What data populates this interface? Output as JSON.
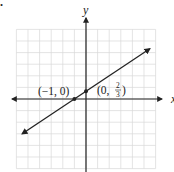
{
  "chart_data": {
    "type": "line",
    "title": "",
    "xlabel": "x",
    "ylabel": "y",
    "xlim": [
      -6,
      6
    ],
    "ylim": [
      -6,
      6
    ],
    "grid": true,
    "grid_step": 1,
    "series": [
      {
        "name": "line",
        "equation": "y = (2/3)x + 2/3",
        "slope": 0.6667,
        "intercept": 0.6667,
        "x": [
          -5.5,
          5.5
        ],
        "values": [
          -3.0,
          4.33
        ]
      }
    ],
    "points": [
      {
        "x": -1,
        "y": 0,
        "label": "(−1, 0)"
      },
      {
        "x": 0,
        "y": 0.6667,
        "label": "(0, 2/3)"
      }
    ],
    "annotations": [
      "(−1, 0)",
      "(0, 2/3)"
    ]
  },
  "labels": {
    "y_axis": "y",
    "x_axis": "x",
    "point_a": "(−1, 0)",
    "point_b_prefix": "(0, ",
    "point_b_num": "2",
    "point_b_den": "3",
    "point_b_suffix": ")",
    "marker": "."
  },
  "colors": {
    "grid": "#d8d8d8",
    "axis": "#222222",
    "line": "#222222"
  }
}
